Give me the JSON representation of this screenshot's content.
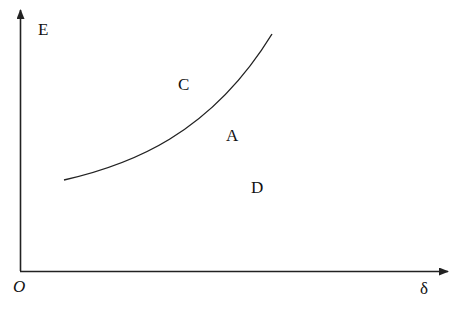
{
  "diagram": {
    "axis_y_label": "E",
    "axis_x_label": "δ",
    "origin_label": "O",
    "region_labels": {
      "c": "C",
      "a": "A",
      "d": "D"
    },
    "colors": {
      "line": "#222222",
      "background": "#ffffff"
    }
  }
}
